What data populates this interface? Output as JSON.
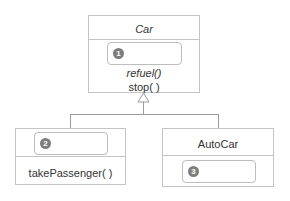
{
  "diagram": {
    "type": "UML class inheritance diagram",
    "parent_class": {
      "name": "Car",
      "name_italic": true,
      "blank_slot": {
        "badge": "1"
      },
      "methods": [
        {
          "label": "refuel()",
          "italic": true
        },
        {
          "label": "stop( )",
          "italic": false
        }
      ]
    },
    "child_classes": [
      {
        "name_slot": {
          "badge": "2"
        },
        "methods": [
          {
            "label": "takePassenger( )"
          }
        ]
      },
      {
        "name": "AutoCar",
        "blank_slot": {
          "badge": "3"
        }
      }
    ],
    "relationship": "generalization (hollow triangle arrow)",
    "colors": {
      "border": "#c4c4c4",
      "badge": "#7d7d7d",
      "connector": "#9a9a9a"
    }
  }
}
